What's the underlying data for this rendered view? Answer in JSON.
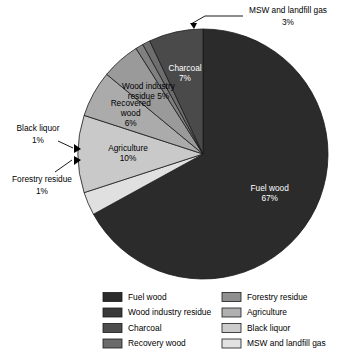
{
  "chart_data": {
    "type": "pie",
    "title": "",
    "legend_position": "bottom",
    "total": 100,
    "units": "%",
    "categories": [
      "Fuel wood",
      "MSW and landfill gas",
      "Agriculture",
      "Recovered wood",
      "Wood industry residue",
      "Black liquor",
      "Forestry residue",
      "Charcoal"
    ],
    "values": [
      67,
      3,
      10,
      6,
      5,
      1,
      1,
      7
    ],
    "slices": [
      {
        "name": "Fuel wood",
        "value": 67,
        "label": "Fuel wood",
        "pct_label": "67%",
        "color": "#2b2b2b",
        "label_placement": "inside",
        "label_color": "light"
      },
      {
        "name": "MSW and landfill gas",
        "value": 3,
        "label": "MSW and landfill gas",
        "pct_label": "3%",
        "color": "#e0e0e0",
        "label_placement": "callout",
        "label_color": "dark"
      },
      {
        "name": "Agriculture",
        "value": 10,
        "label": "Agriculture",
        "pct_label": "10%",
        "color": "#c9c9c9",
        "label_placement": "inside",
        "label_color": "dark"
      },
      {
        "name": "Recovered wood",
        "value": 6,
        "label": "Recovered wood",
        "pct_label": "6%",
        "color": "#ababab",
        "label_placement": "inside",
        "label_color": "dark"
      },
      {
        "name": "Wood industry residue",
        "value": 5,
        "label": "Wood industry residue 5%",
        "pct_label": "5%",
        "color": "#9a9a9a",
        "label_placement": "inside",
        "label_color": "dark"
      },
      {
        "name": "Black liquor",
        "value": 1,
        "label": "Black liquor",
        "pct_label": "1%",
        "color": "#808080",
        "label_placement": "callout",
        "label_color": "dark"
      },
      {
        "name": "Forestry residue",
        "value": 1,
        "label": "Forestry residue",
        "pct_label": "1%",
        "color": "#6e6e6e",
        "label_placement": "callout",
        "label_color": "dark"
      },
      {
        "name": "Charcoal",
        "value": 7,
        "label": "Charcoal",
        "pct_label": "7%",
        "color": "#4a4a4a",
        "label_placement": "inside",
        "label_color": "light"
      }
    ],
    "legend": {
      "column_left": [
        {
          "label": "Fuel wood",
          "color": "#2b2b2b"
        },
        {
          "label": "Wood industry residue",
          "color": "#3a3a3a"
        },
        {
          "label": "Charcoal",
          "color": "#4d4d4d"
        },
        {
          "label": "Recovery wood",
          "color": "#6b6b6b"
        }
      ],
      "column_right": [
        {
          "label": "Forestry residue",
          "color": "#8f8f8f"
        },
        {
          "label": "Agriculture",
          "color": "#b0b0b0"
        },
        {
          "label": "Black liquor",
          "color": "#cccccc"
        },
        {
          "label": "MSW and landfill gas",
          "color": "#e2e2e2"
        }
      ]
    },
    "callouts": [
      {
        "name": "msw-callout",
        "line1": "MSW and landfill gas",
        "line2": "3%"
      },
      {
        "name": "black-liquor-callout",
        "line1": "Black liquor",
        "line2": "1%"
      },
      {
        "name": "forestry-residue-callout",
        "line1": "Forestry residue",
        "line2": "1%"
      }
    ]
  }
}
